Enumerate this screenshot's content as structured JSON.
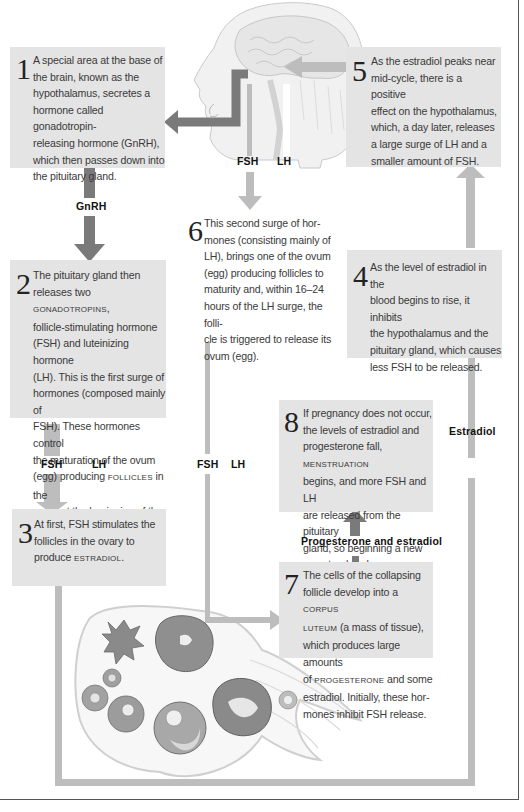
{
  "colors": {
    "box_fill": "#e4e4e4",
    "dark_arrow": "#7a7a7a",
    "light_arrow": "#bdbdbd"
  },
  "steps": [
    {
      "number": "1",
      "lines": [
        "A special area at the base of",
        "the brain, known as the",
        "hypothalamus, secretes a",
        "hormone called gonadotropin-",
        "releasing hormone (GnRH),",
        "which then passes down into",
        "the pituitary gland."
      ]
    },
    {
      "number": "2",
      "lines": [
        "The pituitary gland then",
        "releases two |GONADOTROPINS|,",
        "follicle-stimulating hormone",
        "(FSH) and luteinizing hormone",
        "(LH). This is the first surge of",
        "hormones (composed mainly of",
        "FSH). These hormones control",
        "the maturation of the ovum",
        "(egg) producing |FOLLICLES| in the",
        "ovary at the beginning of the",
        "menstrual cycle."
      ]
    },
    {
      "number": "3",
      "lines": [
        "At first, FSH stimulates the",
        "follicles in the ovary to",
        "produce |ESTRADIOL|."
      ]
    },
    {
      "number": "4",
      "lines": [
        "As the level of estradiol in the",
        "blood begins to rise, it inhibits",
        "the hypothalamus and the",
        "pituitary gland, which causes",
        "less FSH to be released."
      ]
    },
    {
      "number": "5",
      "lines": [
        "As the estradiol peaks near",
        "mid-cycle, there is a positive",
        "effect on the hypothalamus,",
        "which, a day later, releases",
        "a large surge of LH and a",
        "smaller amount of FSH."
      ]
    },
    {
      "number": "6",
      "lines": [
        "This second surge of hor-",
        "mones (consisting mainly of",
        "LH), brings one of the ovum",
        "(egg) producing follicles to",
        "maturity and, within 16–24",
        "hours of the LH surge, the folli-",
        "cle is triggered to release its",
        "ovum (egg)."
      ]
    },
    {
      "number": "7",
      "lines": [
        "The cells of the collapsing",
        "follicle develop into a |CORPUS|",
        "|LUTEUM| (a mass of tissue),",
        "which produces large amounts",
        "of |PROGESTERONE| and some",
        "estradiol. Initially, these hor-",
        "mones inhibit FSH release."
      ]
    },
    {
      "number": "8",
      "lines": [
        "If pregnancy does not occur,",
        "the levels of estradiol and",
        "progesterone fall, |MENSTRUATION|",
        "begins, and more FSH and LH",
        "are released from the pituitary",
        "gland, so beginning a new",
        "menstrual cycle."
      ]
    }
  ],
  "labels": {
    "head_fsh": "FSH",
    "head_lh": "LH",
    "gnrh": "GnRH",
    "left_fsh": "FSH",
    "left_lh": "LH",
    "mid_fsh": "FSH",
    "mid_lh": "LH",
    "estradiol": "Estradiol",
    "progesterone_estradiol": "Progesterone and estradiol"
  },
  "illustrations": {
    "head": "head-brain-illustration",
    "ovary": "ovary-follicles-illustration"
  }
}
